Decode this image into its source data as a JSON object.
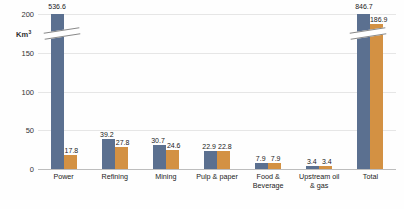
{
  "chart_data": {
    "type": "bar",
    "title": "",
    "xlabel": "",
    "ylabel": "Km³",
    "ylim": [
      0,
      200
    ],
    "ytick_values": [
      0,
      50,
      100,
      150,
      200
    ],
    "ytick_labels": [
      "0",
      "50",
      "100",
      "150",
      "200"
    ],
    "grid": true,
    "legend": "none",
    "axis_break": true,
    "axis_break_note": "Blue bars for Power (536.6) and Total (846.7) exceed the 200 axis maximum and are drawn clipped with a slanted break marker.",
    "categories": [
      "Power",
      "Refining",
      "Mining",
      "Pulp & paper",
      "Food & Beverage",
      "Upstream oil & gas",
      "Total"
    ],
    "category_lines": [
      [
        "Power"
      ],
      [
        "Refining"
      ],
      [
        "Mining"
      ],
      [
        "Pulp & paper"
      ],
      [
        "Food &",
        "Beverage"
      ],
      [
        "Upstream oil",
        "& gas"
      ],
      [
        "Total"
      ]
    ],
    "series": [
      {
        "name": "series-blue",
        "color": "#5b7090",
        "values": [
          536.6,
          39.2,
          30.7,
          22.9,
          7.9,
          3.4,
          846.7
        ],
        "labels": [
          "536.6",
          "39.2",
          "30.7",
          "22.9",
          "7.9",
          "3.4",
          "846.7"
        ],
        "clipped": [
          true,
          false,
          false,
          false,
          false,
          false,
          true
        ]
      },
      {
        "name": "series-orange",
        "color": "#d39143",
        "values": [
          17.8,
          27.8,
          24.6,
          22.8,
          7.9,
          3.4,
          186.9
        ],
        "labels": [
          "17.8",
          "27.8",
          "24.6",
          "22.8",
          "7.9",
          "3.4",
          "186.9"
        ],
        "clipped": [
          false,
          false,
          false,
          false,
          false,
          false,
          false
        ]
      }
    ]
  },
  "colors": {
    "series_blue": "#5b7090",
    "series_orange": "#d39143",
    "gridline": "#e6e6e6",
    "baseline": "#bdbdbd",
    "text": "#222222",
    "background": "#fefefe"
  }
}
